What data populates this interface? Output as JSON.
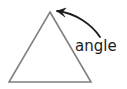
{
  "figure": {
    "background_color": "#ffffff",
    "label": "angle",
    "label_color": "#1a1a1a",
    "label_font_size": 15,
    "label_x": 75,
    "label_y": 51
  },
  "shape": {
    "name": "triangle",
    "kind": "isosceles-triangle",
    "stroke_color": "#808080",
    "fill_color": "none",
    "stroke_width": 1.6,
    "vertices": [
      {
        "name": "apex",
        "x": 50,
        "y": 12
      },
      {
        "name": "bottom-right",
        "x": 91,
        "y": 82
      },
      {
        "name": "bottom-left",
        "x": 9,
        "y": 82
      }
    ],
    "points_attr": "50,12 91,82 9,82"
  },
  "arrow": {
    "name": "curved-pointer-arrow",
    "stroke_color": "#1a1a1a",
    "stroke_width": 1.8,
    "points_to": "apex",
    "path": "M 100 37 C 92 25 76 13 57 11",
    "head_path": "M 57 11 L 66 8 L 62 12.5 L 65 17 Z",
    "tail_x": 100,
    "tail_y": 37,
    "tip_x": 57,
    "tip_y": 11
  },
  "chart_data": {
    "type": "diagram",
    "title": "angle",
    "elements": [
      {
        "type": "polygon",
        "label": "triangle",
        "points": [
          [
            50,
            12
          ],
          [
            91,
            82
          ],
          [
            9,
            82
          ]
        ],
        "stroke": "#808080",
        "fill": "none"
      },
      {
        "type": "curved-arrow",
        "label": "angle",
        "from": [
          100,
          37
        ],
        "to": [
          50,
          12
        ],
        "stroke": "#1a1a1a"
      },
      {
        "type": "text",
        "label": "angle",
        "position": [
          75,
          51
        ],
        "color": "#1a1a1a"
      }
    ],
    "annotations": [
      "angle"
    ],
    "xlabel": "",
    "ylabel": ""
  }
}
